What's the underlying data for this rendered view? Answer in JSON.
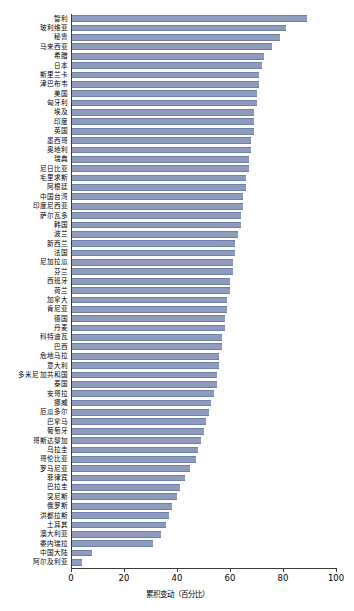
{
  "chart_data": {
    "type": "bar",
    "orientation": "horizontal",
    "title": "",
    "subtitle": "",
    "xlabel": "累积变动（百分比）",
    "ylabel": "",
    "xlim": [
      0,
      100
    ],
    "xticks": [
      0,
      20,
      40,
      60,
      80,
      100
    ],
    "xtick_labels": [
      "0",
      "20",
      "40",
      "60",
      "80",
      "100"
    ],
    "grid": false,
    "legend": null,
    "bar_color": "#8e9bbd",
    "bar_edge_color": "#6e7fa8",
    "axis_color": "#3a3a3a",
    "categories": [
      "智利",
      "玻利维亚",
      "秘鲁",
      "马来西亚",
      "希腊",
      "日本",
      "斯里兰卡",
      "津巴布韦",
      "美国",
      "匈牙利",
      "埃及",
      "印度",
      "英国",
      "墨西哥",
      "奥地利",
      "瑞典",
      "尼日比亚",
      "毛里求斯",
      "阿根廷",
      "中国台湾",
      "印度尼西亚",
      "萨尔瓦多",
      "韩国",
      "波兰",
      "新西兰",
      "法国",
      "尼加拉瓜",
      "芬兰",
      "西班牙",
      "荷兰",
      "加拿大",
      "肯尼亚",
      "德国",
      "丹麦",
      "科特迪瓦",
      "巴西",
      "危地马拉",
      "意大利",
      "多米尼加共和国",
      "泰国",
      "安哥拉",
      "挪威",
      "厄瓜多尔",
      "巴拿马",
      "葡萄牙",
      "哥斯达黎加",
      "乌拉圭",
      "哥伦比亚",
      "罗马尼亚",
      "菲律宾",
      "巴拉圭",
      "突尼斯",
      "俄罗斯",
      "洪都拉斯",
      "土耳其",
      "澳大利亚",
      "委内瑞拉",
      "中国大陆",
      "阿尔及利亚"
    ],
    "values": [
      89,
      81,
      79,
      76,
      73,
      72,
      71,
      71,
      70,
      70,
      69,
      69,
      69,
      68,
      68,
      67,
      67,
      66,
      66,
      65,
      65,
      64,
      64,
      63,
      62,
      62,
      61,
      61,
      60,
      60,
      59,
      59,
      58,
      58,
      57,
      57,
      56,
      56,
      55,
      55,
      54,
      53,
      52,
      51,
      50,
      49,
      48,
      47,
      45,
      43,
      41,
      40,
      38,
      37,
      36,
      34,
      31,
      8,
      4
    ]
  }
}
